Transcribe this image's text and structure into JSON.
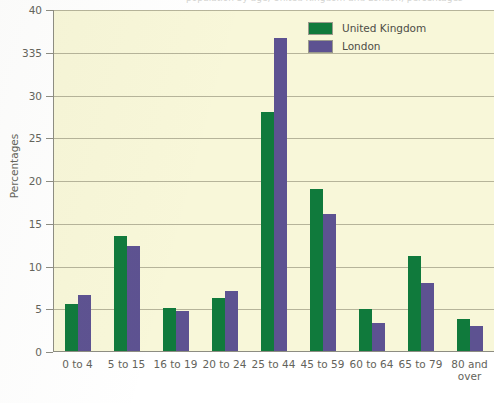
{
  "figure": {
    "background_color": "#ffffff",
    "plot_background_color": "#f8f7d9",
    "axis_color": "#8d8d82",
    "gridline_color": "#b6b49a",
    "top_cropped_caption": "population by age, United Kingdom and London, percentages"
  },
  "chart_data": {
    "type": "bar",
    "title": "",
    "xlabel": "",
    "ylabel": "Percentages",
    "ylim": [
      0,
      40
    ],
    "ytick_labels": [
      "0",
      "5",
      "10",
      "15",
      "20",
      "25",
      "30",
      "335",
      "40"
    ],
    "ytick_values": [
      0,
      5,
      10,
      15,
      20,
      25,
      30,
      35,
      40
    ],
    "grid": true,
    "legend_position": "top-right",
    "categories": [
      "0 to 4",
      "5 to 15",
      "16 to 19",
      "20 to 24",
      "25 to 44",
      "45 to 59",
      "60 to 64",
      "65 to 79",
      "80 and over"
    ],
    "series": [
      {
        "name": "United Kingdom",
        "color": "#107a3c",
        "values": [
          5.5,
          13.5,
          5.0,
          6.2,
          28.0,
          19.0,
          4.9,
          11.1,
          3.8
        ]
      },
      {
        "name": "London",
        "color": "#5d5291",
        "values": [
          6.5,
          12.3,
          4.7,
          7.0,
          36.6,
          16.0,
          3.3,
          8.0,
          2.9
        ]
      }
    ]
  }
}
